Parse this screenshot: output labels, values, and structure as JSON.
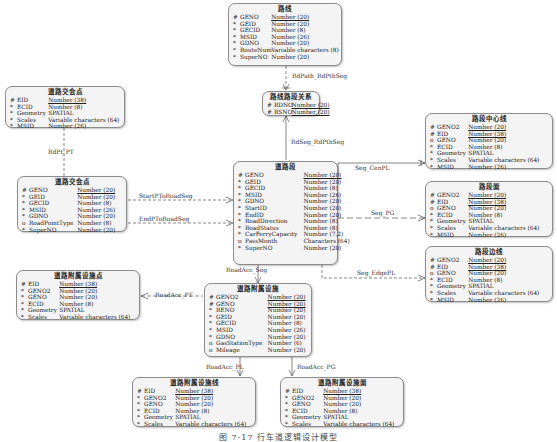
{
  "entities": {
    "luxian": {
      "title": "路线",
      "attrs": [
        {
          "mark": "#",
          "name": "GENO",
          "type": "Number (20)",
          "pk": true
        },
        {
          "mark": "*",
          "name": "GEID",
          "type": "Number (20)"
        },
        {
          "mark": "*",
          "name": "GECID",
          "type": "Number (8)"
        },
        {
          "mark": "*",
          "name": "MSID",
          "type": "Number (26)"
        },
        {
          "mark": "*",
          "name": "GDNO",
          "type": "Number (20)"
        },
        {
          "mark": "*",
          "name": "RouteNum",
          "type": "Variable characters (8)"
        },
        {
          "mark": "*",
          "name": "SuperNO",
          "type": "Number (20)"
        }
      ]
    },
    "luxian_luduan": {
      "title": "路线路段关系",
      "attrs": [
        {
          "mark": "#",
          "name": "RDNO",
          "type": "Number (20)",
          "pk": true
        },
        {
          "mark": "#",
          "name": "RSNO",
          "type": "Number (20)",
          "pk": true
        }
      ]
    },
    "daolu_jiaohuidian_top": {
      "title": "道路交会点",
      "attrs": [
        {
          "mark": "#",
          "name": "EID",
          "type": "Number (38)",
          "pk": true
        },
        {
          "mark": "*",
          "name": "ECID",
          "type": "Number (8)"
        },
        {
          "mark": "*",
          "name": "Geometry",
          "type": "SPATIAL"
        },
        {
          "mark": "*",
          "name": "Scales",
          "type": "Variable characters (64)"
        },
        {
          "mark": "*",
          "name": "MSID",
          "type": "Number (26)"
        }
      ]
    },
    "daolu_jiaohuidian": {
      "title": "道路交会点",
      "attrs": [
        {
          "mark": "#",
          "name": "GENO",
          "type": "Number (20)",
          "pk": true
        },
        {
          "mark": "*",
          "name": "GEID",
          "type": "Number (20)"
        },
        {
          "mark": "*",
          "name": "GECID",
          "type": "Number (8)"
        },
        {
          "mark": "*",
          "name": "MSID",
          "type": "Number (26)"
        },
        {
          "mark": "*",
          "name": "GDNO",
          "type": "Number (20)"
        },
        {
          "mark": "o",
          "name": "RoadPointType",
          "type": "Number (8)"
        },
        {
          "mark": "*",
          "name": "SuperNO",
          "type": "Number (20)"
        }
      ]
    },
    "daolu_duan": {
      "title": "道路段",
      "attrs": [
        {
          "mark": "#",
          "name": "GENO",
          "type": "Number (20)",
          "pk": true
        },
        {
          "mark": "*",
          "name": "GEID",
          "type": "Number (20)"
        },
        {
          "mark": "*",
          "name": "GECID",
          "type": "Number (8)"
        },
        {
          "mark": "*",
          "name": "MSID",
          "type": "Number (26)"
        },
        {
          "mark": "*",
          "name": "GDNO",
          "type": "Number (20)"
        },
        {
          "mark": "*",
          "name": "StartID",
          "type": "Number (20)"
        },
        {
          "mark": "*",
          "name": "EndID",
          "type": "Number (20)"
        },
        {
          "mark": "*",
          "name": "RoadDirection",
          "type": "Number (8)"
        },
        {
          "mark": "*",
          "name": "RoadStatus",
          "type": "Number (8)"
        },
        {
          "mark": "*",
          "name": "CarFerryCapacity",
          "type": "Number (7,2)"
        },
        {
          "mark": "o",
          "name": "PassMonth",
          "type": "Characters (64)"
        },
        {
          "mark": "*",
          "name": "SuperNO",
          "type": "Number (20)"
        }
      ]
    },
    "luduan_zhongxinxian": {
      "title": "路段中心线",
      "attrs": [
        {
          "mark": "#",
          "name": "GENO2",
          "type": "Number (20)",
          "pk": true
        },
        {
          "mark": "#",
          "name": "EID",
          "type": "Number (38)",
          "pk": true
        },
        {
          "mark": "o",
          "name": "GENO",
          "type": "Number (20)"
        },
        {
          "mark": "*",
          "name": "ECID",
          "type": "Number (8)"
        },
        {
          "mark": "*",
          "name": "Geometry",
          "type": "SPATIAL"
        },
        {
          "mark": "*",
          "name": "Scales",
          "type": "Variable characters (64)"
        },
        {
          "mark": "*",
          "name": "MSID",
          "type": "Number (26)"
        }
      ]
    },
    "luduan_mian": {
      "title": "路段面",
      "attrs": [
        {
          "mark": "#",
          "name": "GENO2",
          "type": "Number (20)",
          "pk": true
        },
        {
          "mark": "#",
          "name": "EID",
          "type": "Number (38)",
          "pk": true
        },
        {
          "mark": "o",
          "name": "GENO",
          "type": "Number (20)"
        },
        {
          "mark": "*",
          "name": "ECID",
          "type": "Number (8)"
        },
        {
          "mark": "*",
          "name": "Geometry",
          "type": "SPATIAL"
        },
        {
          "mark": "*",
          "name": "Scales",
          "type": "Variable characters (64)"
        },
        {
          "mark": "*",
          "name": "MSID",
          "type": "Number (26)"
        }
      ]
    },
    "luduan_bianxian": {
      "title": "路段边线",
      "attrs": [
        {
          "mark": "#",
          "name": "GENO2",
          "type": "Number (20)",
          "pk": true
        },
        {
          "mark": "#",
          "name": "EID",
          "type": "Number (38)",
          "pk": true
        },
        {
          "mark": "o",
          "name": "GENO",
          "type": "Number (20)"
        },
        {
          "mark": "*",
          "name": "ECID",
          "type": "Number (8)"
        },
        {
          "mark": "*",
          "name": "Geometry",
          "type": "SPATIAL"
        },
        {
          "mark": "*",
          "name": "Scales",
          "type": "Variable characters (64)"
        },
        {
          "mark": "*",
          "name": "MSID",
          "type": "Number (26)"
        }
      ]
    },
    "fushu_dian": {
      "title": "道路附属设施点",
      "attrs": [
        {
          "mark": "#",
          "name": "EID",
          "type": "Number (38)",
          "pk": true
        },
        {
          "mark": "*",
          "name": "GENO2",
          "type": "Number (20)"
        },
        {
          "mark": "*",
          "name": "GENO",
          "type": "Number (20)"
        },
        {
          "mark": "*",
          "name": "ECID",
          "type": "Number (8)"
        },
        {
          "mark": "*",
          "name": "Geometry",
          "type": "SPATIAL"
        },
        {
          "mark": "*",
          "name": "Scales",
          "type": "Variable characters (64)"
        }
      ]
    },
    "fushu_sheshi": {
      "title": "道路附属设施",
      "attrs": [
        {
          "mark": "#",
          "name": "GENO2",
          "type": "Number (20)",
          "pk": true
        },
        {
          "mark": "#",
          "name": "GENO",
          "type": "Number (20)",
          "pk": true
        },
        {
          "mark": "*",
          "name": "RENO",
          "type": "Number (20)"
        },
        {
          "mark": "*",
          "name": "GEID",
          "type": "Number (20)"
        },
        {
          "mark": "*",
          "name": "GECID",
          "type": "Number (8)"
        },
        {
          "mark": "*",
          "name": "MSID",
          "type": "Number (26)"
        },
        {
          "mark": "*",
          "name": "GDNO",
          "type": "Number (20)"
        },
        {
          "mark": "o",
          "name": "GasStationType",
          "type": "Number (6)"
        },
        {
          "mark": "o",
          "name": "Mileage",
          "type": "Number (20)"
        }
      ]
    },
    "fushu_xian": {
      "title": "道路附属设施线",
      "attrs": [
        {
          "mark": "#",
          "name": "EID",
          "type": "Number (38)",
          "pk": true
        },
        {
          "mark": "*",
          "name": "GENO2",
          "type": "Number (20)"
        },
        {
          "mark": "*",
          "name": "GENO",
          "type": "Number (20)"
        },
        {
          "mark": "*",
          "name": "ECID",
          "type": "Number (8)"
        },
        {
          "mark": "*",
          "name": "Geometry",
          "type": "SPATIAL"
        },
        {
          "mark": "*",
          "name": "Scales",
          "type": "Variable characters (64)"
        }
      ]
    },
    "fushu_mian": {
      "title": "道路附属设施面",
      "attrs": [
        {
          "mark": "#",
          "name": "EID",
          "type": "Number (38)",
          "pk": true
        },
        {
          "mark": "*",
          "name": "GENO2",
          "type": "Number (20)"
        },
        {
          "mark": "*",
          "name": "GENO",
          "type": "Number (20)"
        },
        {
          "mark": "*",
          "name": "ECID",
          "type": "Number (8)"
        },
        {
          "mark": "*",
          "name": "Geometry",
          "type": "SPATIAL"
        },
        {
          "mark": "*",
          "name": "Scales",
          "type": "Variable characters (64)"
        }
      ]
    }
  },
  "relations": {
    "rdpath_rdpthseg": "RdPath_RdPthSeg",
    "rdseg_rdpthseg": "RdSeg_RdPthSeg",
    "rdpt_pt": "RdPt_PT",
    "startpt_roadseg": "StartPToRoadSeg",
    "endpt_roadseg": "EndPToRoadSeg",
    "seg_cenpl": "Seg_CenPL",
    "seg_pg": "Seg_PG",
    "seg_edgepl": "Seg_EdgePL",
    "roadacc_seg": "RoadAcc_Seg",
    "roadacc_pt": "RoadAcc_PT",
    "roadacc_pl": "RoadAcc_PL",
    "roadacc_pg": "RoadAcc_PG"
  },
  "caption": "图 7-17  行车道逻辑设计模型"
}
